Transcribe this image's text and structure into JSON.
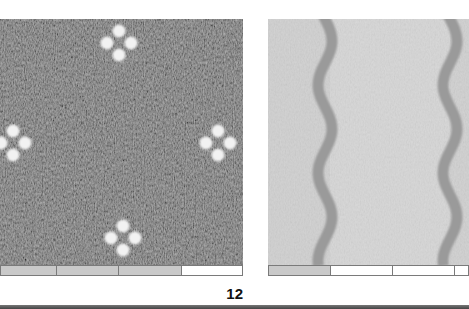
{
  "page": {
    "page_number": "12"
  },
  "figures": [
    {
      "id": "left-swatch",
      "description": "Dark grey textured fabric with white four-dot flower motifs",
      "base_color": "#6b6b6b",
      "motif_color": "#f2f2f2",
      "motifs": [
        {
          "x": 119,
          "y": 24
        },
        {
          "x": 13,
          "y": 124
        },
        {
          "x": 218,
          "y": 124
        },
        {
          "x": 123,
          "y": 219
        }
      ],
      "scale_bar": [
        "grey",
        "grey",
        "grey",
        "white"
      ],
      "scale_bar_widths": [
        56,
        62,
        64,
        61
      ]
    },
    {
      "id": "right-swatch",
      "description": "Light grey fabric with wavy darker vertical bands",
      "base_color": "#cfcfcf",
      "band_color": "#9a9a9a",
      "bands_x": [
        57,
        182
      ],
      "scale_bar": [
        "grey",
        "white",
        "white",
        "white"
      ],
      "scale_bar_widths": [
        62,
        63,
        62,
        14
      ]
    }
  ]
}
